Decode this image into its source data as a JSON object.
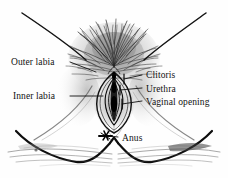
{
  "figure": {
    "style": "black-and-white pen-and-ink line drawing",
    "background_color": "#fefefe",
    "ink_color": "#111111",
    "shading_color": "#8d8d8d"
  },
  "labels": {
    "outer_labia": "Outer labia",
    "inner_labia": "Inner labia",
    "clitoris": "Clitoris",
    "urethra": "Urethra",
    "vaginal_opening": "Vaginal opening",
    "anus": "Anus"
  },
  "parts": [
    {
      "id": "outer-labia",
      "label": "Outer labia",
      "side": "left"
    },
    {
      "id": "inner-labia",
      "label": "Inner labia",
      "side": "left"
    },
    {
      "id": "clitoris",
      "label": "Clitoris",
      "side": "right"
    },
    {
      "id": "urethra",
      "label": "Urethra",
      "side": "right"
    },
    {
      "id": "vaginal-opening",
      "label": "Vaginal opening",
      "side": "right"
    },
    {
      "id": "anus",
      "label": "Anus",
      "side": "bottom"
    }
  ],
  "markers": {
    "anus_marker": "star-ink-mark"
  }
}
